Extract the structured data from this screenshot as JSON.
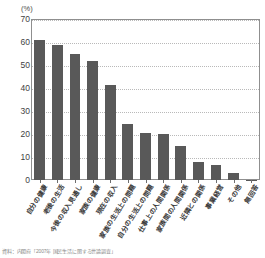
{
  "chart_data": {
    "type": "bar",
    "title": "",
    "subtitle": "",
    "unit_label": "(%)",
    "xlabel": "",
    "ylabel": "",
    "ylim": [
      0,
      70
    ],
    "ytick_values": [
      0,
      10,
      20,
      30,
      40,
      50,
      60,
      70
    ],
    "ytick_labels": [
      "0",
      "10",
      "20",
      "30",
      "40",
      "50",
      "60",
      "70"
    ],
    "grid": true,
    "legend": "none",
    "orientation": "vertical",
    "bar_color": "#595959",
    "categories": [
      "自分の健康",
      "老後の生活",
      "今後の収入見通し",
      "家族の健康",
      "現在の収入",
      "家族の生活上の問題",
      "自分の生活上の問題",
      "仕事上の人間関係",
      "家族間の人間関係",
      "近隣との関係",
      "事業経営",
      "その他",
      "無回答"
    ],
    "values": [
      60.8,
      58.8,
      55.0,
      51.7,
      41.3,
      24.2,
      20.6,
      20.2,
      14.8,
      8.0,
      6.6,
      3.1,
      0.2
    ]
  },
  "footnote": {
    "text": "資料：内閣府「2007年 国民生活に関する世論調査」"
  }
}
